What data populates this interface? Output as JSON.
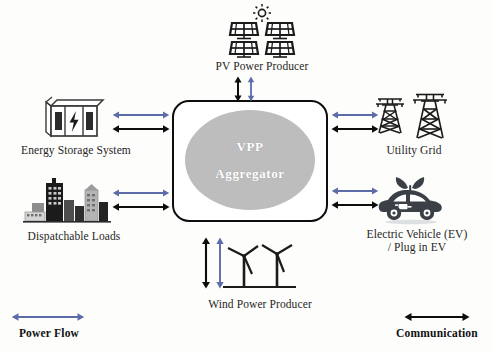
{
  "diagram": {
    "center": {
      "name": "vpp-aggregator",
      "line1": "VPP",
      "line2": "Aggregator",
      "fill": "#bdbdbd",
      "border": "#0d0d0d",
      "text_color": "#ffffff"
    },
    "nodes": [
      {
        "id": "pv",
        "label": "PV Power Producer",
        "icon": "solar-panel-icon",
        "position": "top"
      },
      {
        "id": "ess",
        "label": "Energy Storage System",
        "icon": "battery-cabinet-icon",
        "position": "left-upper"
      },
      {
        "id": "loads",
        "label": "Dispatchable Loads",
        "icon": "city-skyline-icon",
        "position": "left-lower"
      },
      {
        "id": "grid",
        "label": "Utility Grid",
        "icon": "transmission-tower-icon",
        "position": "right-upper"
      },
      {
        "id": "ev",
        "label": "Electric Vehicle (EV)\n/ Plug in EV",
        "icon": "electric-car-icon",
        "position": "right-lower"
      },
      {
        "id": "wind",
        "label": "Wind Power Producer",
        "icon": "wind-turbine-icon",
        "position": "bottom"
      }
    ],
    "legend": [
      {
        "id": "power-flow",
        "label": "Power Flow",
        "color": "#5b6ca8",
        "arrow": "double-headed-arrow"
      },
      {
        "id": "communication",
        "label": "Communication",
        "color": "#0d0d0d",
        "arrow": "double-headed-arrow"
      }
    ],
    "colors": {
      "power_flow": "#5b6ca8",
      "communication": "#0d0d0d",
      "background": "#fdfdfb",
      "icon_dark": "#1b1b1b",
      "icon_mid": "#4a4a4a"
    }
  }
}
